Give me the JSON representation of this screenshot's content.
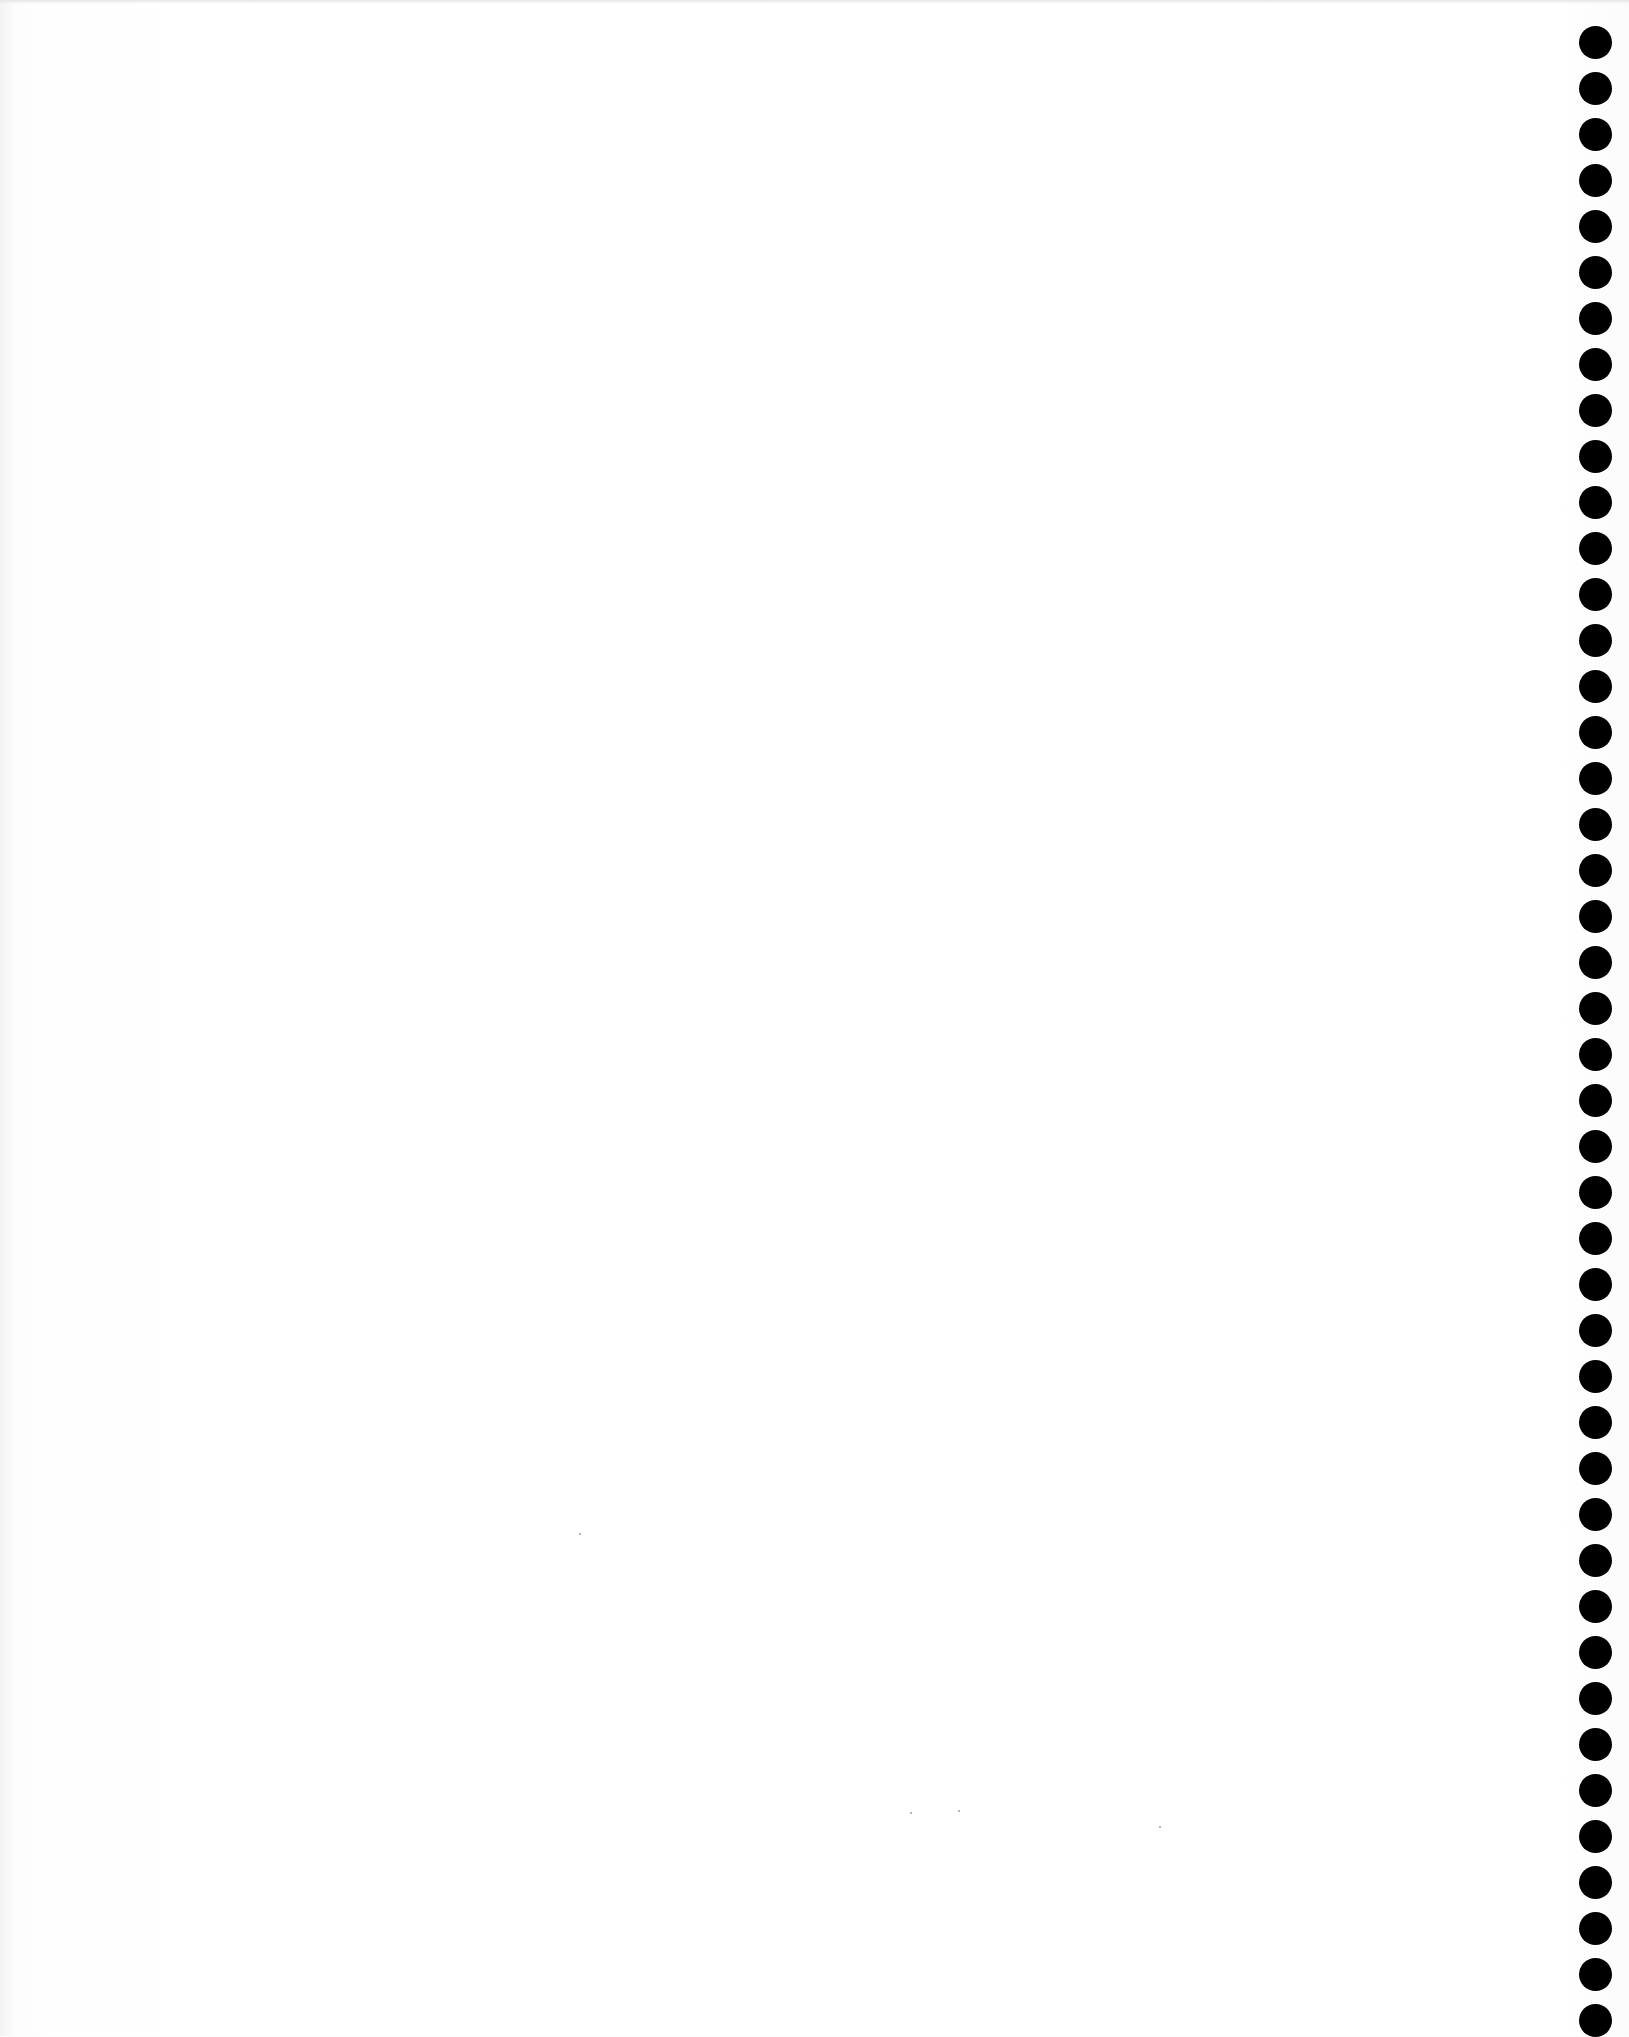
{
  "document": {
    "type": "blank scanned page",
    "text": "",
    "background_color": "#ffffff",
    "binding": {
      "side": "right",
      "hole_color": "#000000",
      "hole_count": 44,
      "hole_diameter_px": 33,
      "hole_pitch_px": 46,
      "first_hole_center_y": 42,
      "hole_center_x": 1595
    },
    "specks": [
      {
        "x": 910,
        "y": 1812
      },
      {
        "x": 958,
        "y": 1810
      },
      {
        "x": 1159,
        "y": 1826
      },
      {
        "x": 579,
        "y": 1533
      }
    ]
  }
}
